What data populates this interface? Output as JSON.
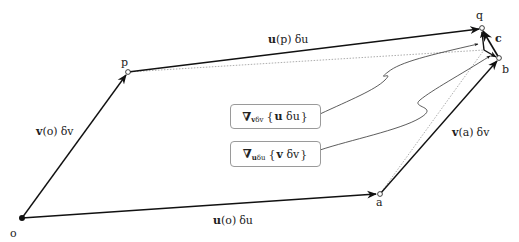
{
  "diagram": {
    "points": {
      "o": {
        "label": "o",
        "x": 22,
        "y": 218,
        "style": "filled"
      },
      "p": {
        "label": "p",
        "x": 128,
        "y": 72,
        "style": "open"
      },
      "a": {
        "label": "a",
        "x": 380,
        "y": 194,
        "style": "open"
      },
      "q": {
        "label": "q",
        "x": 482,
        "y": 28,
        "style": "open"
      },
      "b": {
        "label": "b",
        "x": 499,
        "y": 58,
        "style": "open"
      },
      "m": {
        "label": "",
        "x": 484,
        "y": 50,
        "style": "none"
      }
    },
    "vectors": {
      "v_o": {
        "vec": "v",
        "arg": "(o)",
        "delta": "δv"
      },
      "u_p": {
        "vec": "u",
        "arg": "(p)",
        "delta": "δu"
      },
      "u_o": {
        "vec": "u",
        "arg": "(o)",
        "delta": "δu"
      },
      "v_a": {
        "vec": "v",
        "arg": "(a)",
        "delta": "δv"
      },
      "c": {
        "vec": "c"
      }
    },
    "boxes": [
      {
        "nabla": "∇",
        "sub_vec": "v",
        "sub_delta": "δv",
        "open": "{",
        "vec": "u",
        "delta": "δu",
        "close": "}"
      },
      {
        "nabla": "∇",
        "sub_vec": "u",
        "sub_delta": "δu",
        "open": "{",
        "vec": "v",
        "delta": "δv",
        "close": "}"
      }
    ],
    "colors": {
      "stroke": "#111111",
      "dotted": "#8a8a8a",
      "box_border": "#9a9a9a",
      "text": "#222222"
    }
  }
}
